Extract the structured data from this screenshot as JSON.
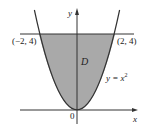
{
  "diagram": {
    "type": "region-plot",
    "curve": {
      "equation": "y = x^2",
      "label_lhs": "y = x",
      "label_exp": "2"
    },
    "region": {
      "label": "D",
      "fill": "#a9a9a9",
      "bounded_by": [
        "y = x^2",
        "y = 4"
      ]
    },
    "horizontal_line": {
      "y": 4
    },
    "points": [
      {
        "label": "(−2, 4)",
        "x": -2,
        "y": 4
      },
      {
        "label": "(2, 4)",
        "x": 2,
        "y": 4
      }
    ],
    "origin_label": "0",
    "axes": {
      "x_label": "x",
      "y_label": "y"
    },
    "colors": {
      "stroke": "#333333",
      "fill": "#a9a9a9",
      "background": "#ffffff"
    }
  }
}
